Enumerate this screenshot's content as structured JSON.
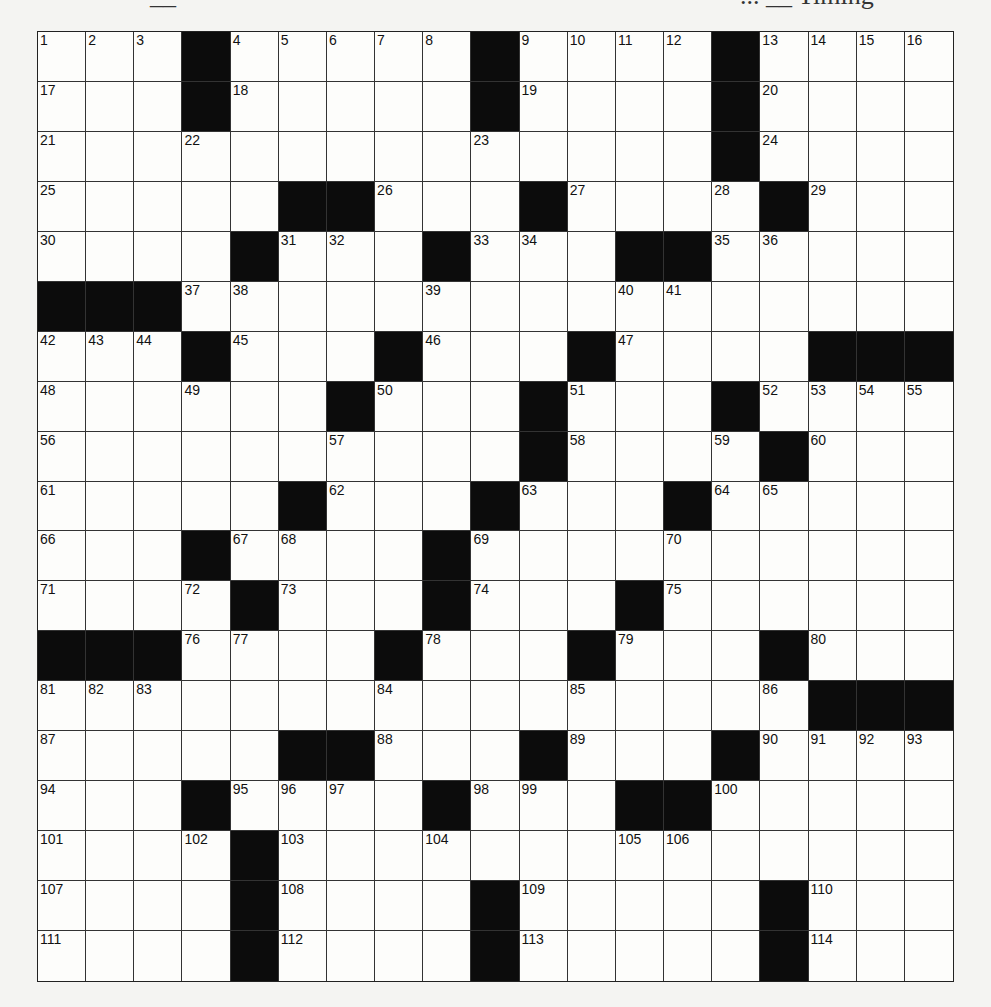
{
  "header": {
    "left_text": "__",
    "right_text": "... __ Timing"
  },
  "puzzle": {
    "rows": 19,
    "cols": 19,
    "grid": [
      [
        "1",
        "2",
        "3",
        "#",
        "4",
        "5",
        "6",
        "7",
        "8",
        "#",
        "9",
        "10",
        "11",
        "12",
        "#",
        "13",
        "14",
        "15",
        "16"
      ],
      [
        "17",
        "",
        "",
        "#",
        "18",
        "",
        "",
        "",
        "",
        "#",
        "19",
        "",
        "",
        "",
        "#",
        "20",
        "",
        "",
        ""
      ],
      [
        "21",
        "",
        "",
        "22",
        "",
        "",
        "",
        "",
        "",
        "23",
        "",
        "",
        "",
        "",
        "#",
        "24",
        "",
        "",
        ""
      ],
      [
        "25",
        "",
        "",
        "",
        "",
        "#",
        "#",
        "26",
        "",
        "",
        "#",
        "27",
        "",
        "",
        "28",
        "#",
        "29",
        "",
        ""
      ],
      [
        "30",
        "",
        "",
        "",
        "#",
        "31",
        "32",
        "",
        "#",
        "33",
        "34",
        "",
        "#",
        "#",
        "35",
        "36",
        "",
        "",
        ""
      ],
      [
        "#",
        "#",
        "#",
        "37",
        "38",
        "",
        "",
        "",
        "39",
        "",
        "",
        "",
        "40",
        "41",
        "",
        "",
        "",
        "",
        ""
      ],
      [
        "42",
        "43",
        "44",
        "#",
        "45",
        "",
        "",
        "#",
        "46",
        "",
        "",
        "#",
        "47",
        "",
        "",
        "",
        "#",
        "#",
        "#"
      ],
      [
        "48",
        "",
        "",
        "49",
        "",
        "",
        "#",
        "50",
        "",
        "",
        "#",
        "51",
        "",
        "",
        "#",
        "52",
        "53",
        "54",
        "55"
      ],
      [
        "56",
        "",
        "",
        "",
        "",
        "",
        "57",
        "",
        "",
        "",
        "#",
        "58",
        "",
        "",
        "59",
        "#",
        "60",
        "",
        ""
      ],
      [
        "61",
        "",
        "",
        "",
        "",
        "#",
        "62",
        "",
        "",
        "#",
        "63",
        "",
        "",
        "#",
        "64",
        "65",
        "",
        "",
        ""
      ],
      [
        "66",
        "",
        "",
        "#",
        "67",
        "68",
        "",
        "",
        "#",
        "69",
        "",
        "",
        "",
        "70",
        "",
        "",
        "",
        "",
        ""
      ],
      [
        "71",
        "",
        "",
        "72",
        "#",
        "73",
        "",
        "",
        "#",
        "74",
        "",
        "",
        "#",
        "75",
        "",
        "",
        "",
        "",
        ""
      ],
      [
        "#",
        "#",
        "#",
        "76",
        "77",
        "",
        "",
        "#",
        "78",
        "",
        "",
        "#",
        "79",
        "",
        "",
        "#",
        "80",
        "",
        ""
      ],
      [
        "81",
        "82",
        "83",
        "",
        "",
        "",
        "",
        "84",
        "",
        "",
        "",
        "85",
        "",
        "",
        "",
        "86",
        "#",
        "#",
        "#"
      ],
      [
        "87",
        "",
        "",
        "",
        "",
        "#",
        "#",
        "88",
        "",
        "",
        "#",
        "89",
        "",
        "",
        "#",
        "90",
        "91",
        "92",
        "93"
      ],
      [
        "94",
        "",
        "",
        "#",
        "95",
        "96",
        "97",
        "",
        "#",
        "98",
        "99",
        "",
        "#",
        "#",
        "100",
        "",
        "",
        "",
        ""
      ],
      [
        "101",
        "",
        "",
        "102",
        "#",
        "103",
        "",
        "",
        "104",
        "",
        "",
        "",
        "105",
        "106",
        "",
        "",
        "",
        "",
        ""
      ],
      [
        "107",
        "",
        "",
        "",
        "#",
        "108",
        "",
        "",
        "",
        "#",
        "109",
        "",
        "",
        "",
        "",
        "#",
        "110",
        "",
        ""
      ],
      [
        "111",
        "",
        "",
        "",
        "#",
        "112",
        "",
        "",
        "",
        "#",
        "113",
        "",
        "",
        "",
        "",
        "#",
        "114",
        "",
        ""
      ]
    ]
  },
  "colors": {
    "black_cell": "#0c0c0c",
    "white_cell": "#fdfdfb",
    "grid_line": "#333333",
    "page_bg": "#f4f4f2"
  }
}
